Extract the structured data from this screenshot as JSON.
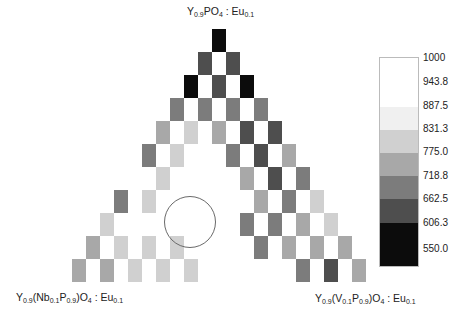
{
  "chart_data": {
    "type": "heatmap",
    "subtype": "ternary-composition-map",
    "title": "",
    "vertices": {
      "top": {
        "base": "Y",
        "parts": [
          [
            "Y",
            ""
          ],
          [
            "0.9",
            "sub"
          ],
          [
            "PO",
            ""
          ],
          [
            "4",
            "sub"
          ],
          [
            " : Eu",
            ""
          ],
          [
            "0.1",
            "sub"
          ]
        ],
        "text": "Y0.9PO4 : Eu0.1"
      },
      "bottom_left": {
        "parts": [
          [
            "Y",
            ""
          ],
          [
            "0.9",
            "sub"
          ],
          [
            "(Nb",
            ""
          ],
          [
            "0.1",
            "sub"
          ],
          [
            "P",
            ""
          ],
          [
            "0.9",
            "sub"
          ],
          [
            ")O",
            ""
          ],
          [
            "4",
            "sub"
          ],
          [
            " : Eu",
            ""
          ],
          [
            "0.1",
            "sub"
          ]
        ],
        "text": "Y0.9(Nb0.1P0.9)O4 : Eu0.1"
      },
      "bottom_right": {
        "parts": [
          [
            "Y",
            ""
          ],
          [
            "0.9",
            "sub"
          ],
          [
            "(V",
            ""
          ],
          [
            "0.1",
            "sub"
          ],
          [
            "P",
            ""
          ],
          [
            "0.9",
            "sub"
          ],
          [
            ")O",
            ""
          ],
          [
            "4",
            "sub"
          ],
          [
            " : Eu",
            ""
          ],
          [
            "0.1",
            "sub"
          ]
        ],
        "text": "Y0.9(V0.1P0.9)O4 : Eu0.1"
      }
    },
    "colorbar": {
      "ticks": [
        "1000",
        "943.8",
        "887.5",
        "831.3",
        "775.0",
        "718.8",
        "662.5",
        "606.3",
        "550.0"
      ],
      "range": [
        550,
        1000
      ],
      "bands": [
        {
          "min": 943.8,
          "max": 1000,
          "color": "#ffffff"
        },
        {
          "min": 887.5,
          "max": 943.8,
          "color": "#ffffff"
        },
        {
          "min": 831.3,
          "max": 887.5,
          "color": "#f0f0f0"
        },
        {
          "min": 775.0,
          "max": 831.3,
          "color": "#d0d0d0"
        },
        {
          "min": 718.8,
          "max": 775.0,
          "color": "#a8a8a8"
        },
        {
          "min": 662.5,
          "max": 718.8,
          "color": "#7c7c7c"
        },
        {
          "min": 606.3,
          "max": 662.5,
          "color": "#4e4e4e"
        },
        {
          "min": 550.0,
          "max": 606.3,
          "color": "#0c0c0c"
        }
      ]
    },
    "grid": {
      "rows": 11,
      "cell_width": 14,
      "cell_height": 23,
      "x_step": 28,
      "apex_x": 212,
      "apex_y": 29
    },
    "rows": [
      [
        570
      ],
      [
        640,
        640
      ],
      [
        580,
        640,
        580
      ],
      [
        690,
        690,
        690,
        690
      ],
      [
        770,
        820,
        770,
        630,
        640
      ],
      [
        690,
        820,
        900,
        700,
        630,
        770
      ],
      [
        930,
        820,
        910,
        1000,
        760,
        620,
        700
      ],
      [
        680,
        830,
        1000,
        1000,
        935,
        760,
        700,
        820
      ],
      [
        820,
        930,
        1000,
        1000,
        1000,
        690,
        690,
        760,
        830
      ],
      [
        760,
        820,
        820,
        820,
        1000,
        940,
        690,
        760,
        760,
        770
      ],
      [
        750,
        745,
        830,
        830,
        830,
        1000,
        1000,
        1000,
        700,
        640,
        760
      ]
    ],
    "annotation": {
      "type": "circle",
      "cx": 190,
      "cy": 222,
      "r": 26,
      "color": "#6a6a6a"
    }
  }
}
